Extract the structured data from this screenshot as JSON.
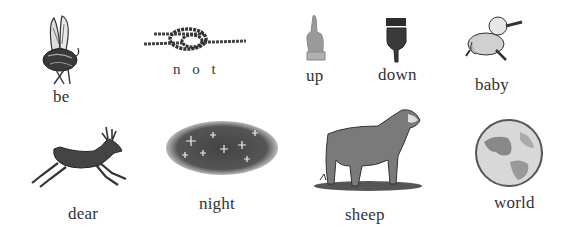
{
  "colors": {
    "background": "#ffffff",
    "ink": "#2a2a2a",
    "hand_up": "#9a9a9a",
    "hand_down": "#3a3a3a"
  },
  "items": [
    {
      "label": "be",
      "picture": "bee-icon"
    },
    {
      "label": "n o t",
      "picture": "knot-icon"
    },
    {
      "label": "up",
      "picture": "hand-pointing-up-icon"
    },
    {
      "label": "down",
      "picture": "hand-pointing-down-icon"
    },
    {
      "label": "baby",
      "picture": "baby-crawling-icon"
    },
    {
      "label": "dear",
      "picture": "deer-leaping-icon"
    },
    {
      "label": "night",
      "picture": "starry-night-sky-icon"
    },
    {
      "label": "sheep",
      "picture": "sheep-icon"
    },
    {
      "label": "world",
      "picture": "globe-icon"
    }
  ]
}
